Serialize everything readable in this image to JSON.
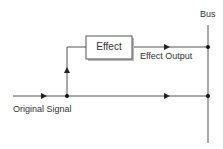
{
  "diagram": {
    "labels": {
      "bus": "Bus",
      "effect_box": "Effect",
      "effect_output": "Effect Output",
      "original_signal": "Original Signal"
    },
    "colors": {
      "line": "#444444",
      "box_border": "#555555",
      "box_shadow": "#bbbbbb",
      "text": "#333333",
      "background": "#ffffff"
    },
    "nodes": [
      {
        "id": "split-junction",
        "x": 67,
        "y": 96
      },
      {
        "id": "bus-junction-effect",
        "x": 208,
        "y": 47
      },
      {
        "id": "bus-junction-dry",
        "x": 208,
        "y": 96
      }
    ],
    "edges": [
      {
        "from": "original-signal-input",
        "to": "split-junction"
      },
      {
        "from": "split-junction",
        "to": "bus-junction-dry"
      },
      {
        "from": "split-junction",
        "to": "effect-box"
      },
      {
        "from": "effect-box",
        "to": "bus-junction-effect"
      }
    ]
  }
}
